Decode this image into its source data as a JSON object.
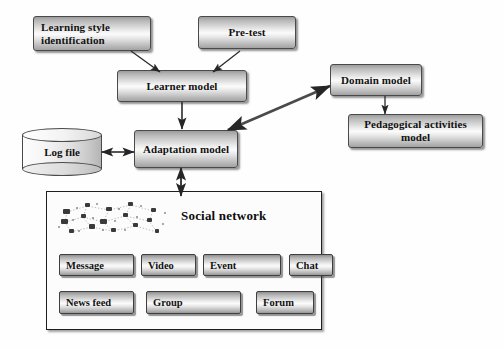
{
  "diagram": {
    "background_color": "#fefefe",
    "box_border_color": "#4a4a4a",
    "text_color": "#111111"
  },
  "nodes": {
    "learning_style": {
      "label": "Learning style identification",
      "shape": "rounded-rectangle"
    },
    "pre_test": {
      "label": "Pre-test",
      "shape": "rounded-rectangle"
    },
    "learner_model": {
      "label": "Learner model",
      "shape": "rounded-rectangle"
    },
    "domain_model": {
      "label": "Domain model",
      "shape": "rounded-rectangle"
    },
    "pedagogical_model": {
      "label": "Pedagogical activities model",
      "shape": "rounded-rectangle"
    },
    "adaptation_model": {
      "label": "Adaptation model",
      "shape": "rounded-rectangle"
    },
    "log_file": {
      "label": "Log file",
      "shape": "cylinder"
    }
  },
  "social_network": {
    "title": "Social network",
    "icon": "node-cluster-icon",
    "buttons_row1": [
      {
        "label": "Message"
      },
      {
        "label": "Video"
      },
      {
        "label": "Event"
      },
      {
        "label": "Chat"
      }
    ],
    "buttons_row2": [
      {
        "label": "News feed"
      },
      {
        "label": "Group"
      },
      {
        "label": "Forum"
      }
    ]
  },
  "connections": [
    {
      "from": "learning_style",
      "to": "learner_model",
      "arrow": "single"
    },
    {
      "from": "pre_test",
      "to": "learner_model",
      "arrow": "single"
    },
    {
      "from": "learner_model",
      "to": "adaptation_model",
      "arrow": "single"
    },
    {
      "from": "domain_model",
      "to": "pedagogical_model",
      "arrow": "single"
    },
    {
      "from": "adaptation_model",
      "to": "domain_model",
      "arrow": "double"
    },
    {
      "from": "log_file",
      "to": "adaptation_model",
      "arrow": "double"
    },
    {
      "from": "adaptation_model",
      "to": "social_network",
      "arrow": "double"
    }
  ]
}
